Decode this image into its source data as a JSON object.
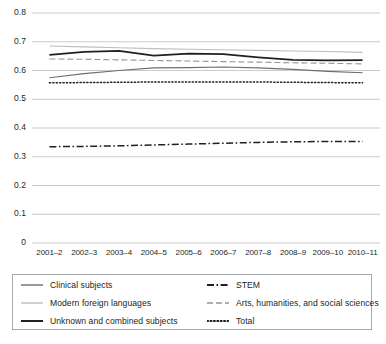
{
  "chart_data": {
    "type": "line",
    "title": "",
    "xlabel": "",
    "ylabel": "",
    "ylim": [
      0,
      0.8
    ],
    "ytick_labels": [
      "0.8",
      "0.7",
      "0.6",
      "0.5",
      "0.4",
      "0.3",
      "0.2",
      "0.1",
      "0"
    ],
    "ytick_values": [
      0.8,
      0.7,
      0.6,
      0.5,
      0.4,
      0.3,
      0.2,
      0.1,
      0
    ],
    "grid": "horizontal",
    "legend_position": "below-plot",
    "categories": [
      "2001–2",
      "2002–3",
      "2003–4",
      "2004–5",
      "2005–6",
      "2006–7",
      "2007–8",
      "2008–9",
      "2009–10",
      "2010–11"
    ],
    "series": [
      {
        "name": "Clinical subjects",
        "style": "solid",
        "color": "#6d6e71",
        "width": 1.1,
        "values": [
          0.575,
          0.589,
          0.6,
          0.609,
          0.61,
          0.612,
          0.609,
          0.604,
          0.597,
          0.592
        ]
      },
      {
        "name": "Modern foreign languages",
        "style": "solid",
        "color": "#bcbec0",
        "width": 1.1,
        "values": [
          0.685,
          0.682,
          0.679,
          0.676,
          0.674,
          0.672,
          0.67,
          0.668,
          0.666,
          0.663
        ]
      },
      {
        "name": "Unknown and combined subjects",
        "style": "solid",
        "color": "#231f20",
        "width": 1.7,
        "values": [
          0.654,
          0.665,
          0.668,
          0.652,
          0.659,
          0.657,
          0.646,
          0.637,
          0.635,
          0.636
        ]
      },
      {
        "name": "STEM",
        "style": "dashdot",
        "color": "#231f20",
        "width": 1.5,
        "values": [
          0.335,
          0.336,
          0.338,
          0.341,
          0.344,
          0.347,
          0.35,
          0.352,
          0.353,
          0.353
        ]
      },
      {
        "name": "Arts, humanities, and social sciences",
        "style": "dashed",
        "color": "#939598",
        "width": 1.1,
        "values": [
          0.64,
          0.639,
          0.637,
          0.635,
          0.633,
          0.631,
          0.629,
          0.627,
          0.625,
          0.623
        ]
      },
      {
        "name": "Total",
        "style": "dotted",
        "color": "#231f20",
        "width": 1.5,
        "values": [
          0.557,
          0.558,
          0.559,
          0.56,
          0.56,
          0.56,
          0.56,
          0.559,
          0.558,
          0.557
        ]
      }
    ]
  },
  "legend": {
    "columns": [
      {
        "entries": [
          {
            "label": "Clinical subjects",
            "swatch": "solid-gray-line-icon"
          },
          {
            "label": "Modern foreign languages",
            "swatch": "solid-lightgray-line-icon"
          },
          {
            "label": "Unknown and combined subjects",
            "swatch": "solid-black-line-icon"
          }
        ]
      },
      {
        "entries": [
          {
            "label": "STEM",
            "swatch": "dashdot-black-line-icon"
          },
          {
            "label": "Arts, humanities, and social sciences",
            "swatch": "dashed-gray-line-icon"
          },
          {
            "label": "Total",
            "swatch": "dotted-black-line-icon"
          }
        ]
      }
    ]
  },
  "colors": {
    "gridline": "#bcbec0",
    "axis_text": "#231f20",
    "legend_border": "#a7a9ac",
    "background": "#ffffff"
  }
}
